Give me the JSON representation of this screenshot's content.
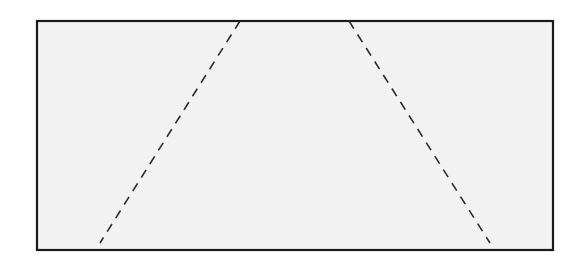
{
  "diagram": {
    "background": "#ffffff",
    "rectangle": {
      "x": 37,
      "y": 21,
      "width": 516,
      "height": 229,
      "fill": "#f2f2f2",
      "stroke": "#1a1a1a",
      "stroke_width": 2.2
    },
    "dashed_lines": [
      {
        "name": "left-diagonal",
        "x1": 240,
        "y1": 21,
        "x2": 100,
        "y2": 243,
        "stroke": "#2a2a2a",
        "stroke_width": 1.6,
        "dash": "9 7"
      },
      {
        "name": "right-diagonal",
        "x1": 349,
        "y1": 21,
        "x2": 490,
        "y2": 243,
        "stroke": "#2a2a2a",
        "stroke_width": 1.6,
        "dash": "9 7"
      }
    ]
  }
}
